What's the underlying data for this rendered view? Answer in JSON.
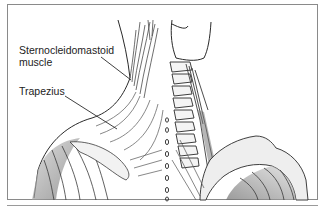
{
  "figure": {
    "labels": [
      {
        "id": "sternocleidomastoid",
        "lines": [
          "Sternocleidomastoid",
          "muscle"
        ]
      },
      {
        "id": "trapezius",
        "lines": [
          "Trapezius"
        ]
      }
    ]
  },
  "colors": {
    "line": "#2a2a2a",
    "shade": "#9a9a9a",
    "frame": "#8a8a8a",
    "background": "#ffffff"
  }
}
